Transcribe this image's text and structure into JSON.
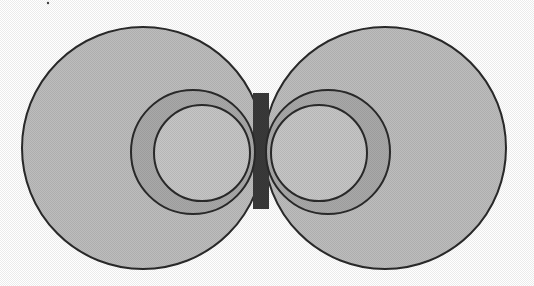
{
  "diagram": {
    "width": 534,
    "height": 286,
    "background": "#ffffff",
    "stroke_color": "#2a2a2a",
    "colors": {
      "outer_fill": "#bdbdbd",
      "ring_fill": "#a9a9a9",
      "inner_fill": "#c6c6c6",
      "core_fill": "#3a3a3a",
      "highlight": "#d8d8d8"
    },
    "left_lobe": {
      "outer": {
        "cx": 143,
        "cy": 148,
        "r": 121
      },
      "ring": {
        "cx": 193,
        "cy": 152,
        "r": 62
      },
      "inner": {
        "cx": 202,
        "cy": 153,
        "r": 48
      }
    },
    "right_lobe": {
      "outer": {
        "cx": 385,
        "cy": 148,
        "r": 121
      },
      "ring": {
        "cx": 328,
        "cy": 152,
        "r": 62
      },
      "inner": {
        "cx": 319,
        "cy": 153,
        "r": 48
      }
    },
    "core": {
      "x": 253,
      "y": 93,
      "width": 16,
      "height": 116
    },
    "stray_mark": {
      "x": 48,
      "y": 3
    }
  }
}
